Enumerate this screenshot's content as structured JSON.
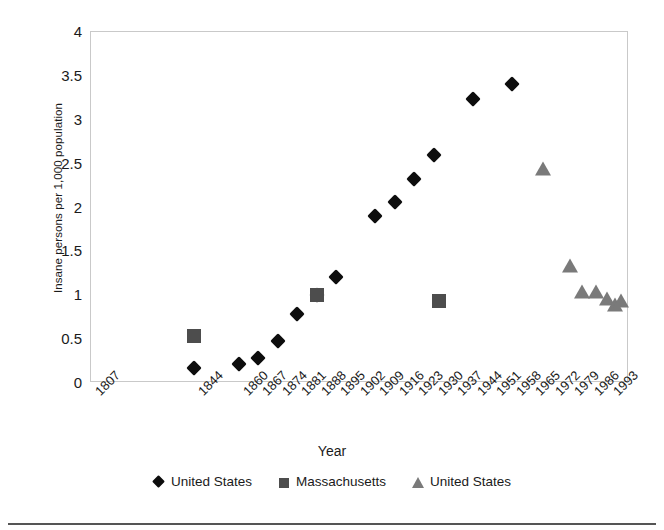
{
  "chart_data": {
    "type": "scatter",
    "title": "",
    "xlabel": "Year",
    "ylabel": "Insane persons per 1,000 population",
    "ylim": [
      0,
      4
    ],
    "yticks": [
      "0",
      "0.5",
      "1",
      "1.5",
      "2",
      "2.5",
      "3",
      "3.5",
      "4"
    ],
    "ytick_values": [
      0,
      0.5,
      1,
      1.5,
      2,
      2.5,
      3,
      3.5,
      4
    ],
    "xlim": [
      1807,
      2000
    ],
    "categories": [
      "1807",
      "1844",
      "1860",
      "1867",
      "1874",
      "1881",
      "1888",
      "1895",
      "1902",
      "1909",
      "1916",
      "1923",
      "1930",
      "1937",
      "1944",
      "1951",
      "1958",
      "1965",
      "1972",
      "1979",
      "1986",
      "1993"
    ],
    "grid": false,
    "legend_position": "bottom",
    "series": [
      {
        "name": "United States",
        "marker": "diamond",
        "color": "#0d0d0d",
        "points": [
          {
            "x": 1844,
            "y": 0.17
          },
          {
            "x": 1860,
            "y": 0.22
          },
          {
            "x": 1867,
            "y": 0.28
          },
          {
            "x": 1874,
            "y": 0.48
          },
          {
            "x": 1881,
            "y": 0.79
          },
          {
            "x": 1888,
            "y": 1.0
          },
          {
            "x": 1895,
            "y": 1.21
          },
          {
            "x": 1909,
            "y": 1.9
          },
          {
            "x": 1916,
            "y": 2.06
          },
          {
            "x": 1923,
            "y": 2.32
          },
          {
            "x": 1930,
            "y": 2.6
          },
          {
            "x": 1944,
            "y": 3.24
          },
          {
            "x": 1958,
            "y": 3.41
          }
        ]
      },
      {
        "name": "Massachusetts",
        "marker": "square",
        "color": "#4d4d4d",
        "points": [
          {
            "x": 1844,
            "y": 0.53
          },
          {
            "x": 1888,
            "y": 1.0
          },
          {
            "x": 1932,
            "y": 0.94
          }
        ]
      },
      {
        "name": "United States",
        "marker": "triangle",
        "color": "#7a7a7a",
        "points": [
          {
            "x": 1969,
            "y": 2.43
          },
          {
            "x": 1979,
            "y": 1.32
          },
          {
            "x": 1983,
            "y": 1.02
          },
          {
            "x": 1988,
            "y": 1.02
          },
          {
            "x": 1992,
            "y": 0.95
          },
          {
            "x": 1995,
            "y": 0.88
          },
          {
            "x": 1997,
            "y": 0.92
          }
        ]
      }
    ]
  },
  "axes": {
    "y_title": "Insane persons per 1,000 population",
    "x_title": "Year"
  },
  "legend": {
    "entries": [
      {
        "label": "United States",
        "marker": "diamond"
      },
      {
        "label": "Massachusetts",
        "marker": "square"
      },
      {
        "label": "United States",
        "marker": "triangle"
      }
    ]
  }
}
